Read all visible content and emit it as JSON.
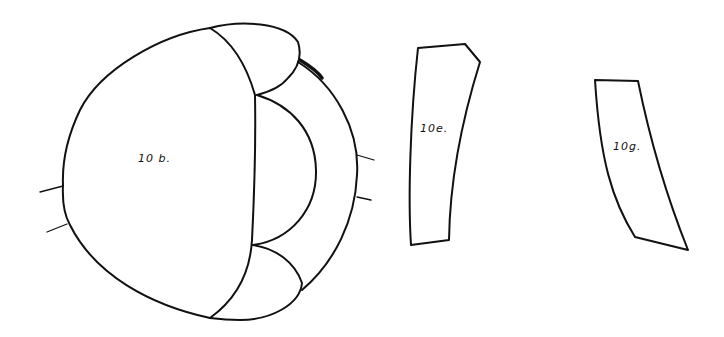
{
  "diagram": {
    "pieces": [
      {
        "id": "10b",
        "label": "10 b."
      },
      {
        "id": "10e",
        "label": "10e."
      },
      {
        "id": "10g",
        "label": "10g."
      }
    ],
    "colors": {
      "line": "#111111",
      "background": "#ffffff"
    }
  }
}
